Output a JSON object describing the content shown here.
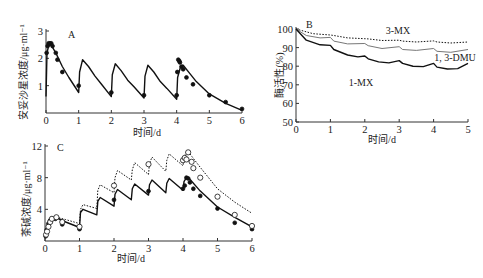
{
  "chart_data": [
    {
      "panel": "A",
      "type": "line",
      "title": "",
      "panel_label": "A",
      "xlabel": "时间/d",
      "ylabel": "安妥沙星浓度/μg·ml⁻¹",
      "xlim": [
        0,
        6
      ],
      "ylim": [
        0,
        3
      ],
      "xticks": [
        "0",
        "1",
        "2",
        "3",
        "4",
        "5",
        "6"
      ],
      "yticks": [
        "1",
        "2",
        "3"
      ],
      "grid": false,
      "series": [
        {
          "name": "model",
          "style": "solid",
          "x": [
            0,
            0.03,
            0.08,
            0.15,
            0.3,
            0.5,
            0.7,
            1.0,
            1.03,
            1.12,
            1.3,
            1.5,
            1.7,
            2.0,
            2.03,
            2.12,
            2.3,
            2.5,
            2.7,
            3.0,
            3.03,
            3.12,
            3.3,
            3.5,
            3.7,
            4.0,
            4.03,
            4.12,
            4.2,
            4.4,
            4.6,
            5.0,
            5.5,
            6.0
          ],
          "y": [
            0.6,
            2.2,
            2.45,
            2.5,
            2.2,
            1.7,
            1.3,
            0.75,
            1.5,
            1.95,
            1.7,
            1.35,
            1.05,
            0.6,
            1.4,
            1.8,
            1.55,
            1.2,
            0.95,
            0.55,
            1.35,
            1.75,
            1.5,
            1.15,
            0.9,
            0.5,
            1.3,
            1.7,
            1.75,
            1.45,
            1.15,
            0.7,
            0.35,
            0.1
          ]
        },
        {
          "name": "observed",
          "style": "filled-circle",
          "x": [
            0.02,
            0.05,
            0.08,
            0.12,
            0.16,
            0.2,
            0.3,
            0.35,
            0.5,
            1.0,
            2.0,
            3.0,
            4.0,
            4.02,
            4.05,
            4.08,
            4.1,
            4.15,
            4.2,
            4.3,
            4.5,
            5.0,
            5.5,
            6.0
          ],
          "y": [
            2.2,
            2.45,
            2.55,
            2.55,
            2.55,
            2.45,
            2.2,
            1.95,
            1.5,
            1.0,
            0.75,
            0.65,
            0.65,
            1.5,
            1.95,
            1.9,
            1.85,
            1.7,
            1.6,
            1.3,
            1.05,
            0.65,
            0.4,
            0.15
          ]
        }
      ]
    },
    {
      "panel": "B",
      "type": "line",
      "panel_label": "B",
      "xlabel": "时间/d",
      "ylabel": "酶活性(%)",
      "xlim": [
        0,
        5
      ],
      "ylim": [
        50,
        100
      ],
      "xticks": [
        "0",
        "1",
        "2",
        "3",
        "4",
        "5"
      ],
      "yticks": [
        "50",
        "60",
        "70",
        "80",
        "90",
        "100"
      ],
      "grid": false,
      "series": [
        {
          "name": "3-MX",
          "style": "dotted",
          "x": [
            0,
            0.5,
            1.0,
            1.1,
            1.5,
            2.0,
            2.1,
            2.5,
            3.0,
            3.1,
            3.5,
            4.0,
            4.1,
            4.5,
            5.0
          ],
          "y": [
            100,
            97.5,
            96.8,
            96.5,
            95.2,
            94.8,
            94.7,
            93.8,
            94,
            93.5,
            93,
            93.6,
            93,
            92.5,
            93
          ]
        },
        {
          "name": "1, 3-DMU",
          "style": "solid-gray",
          "x": [
            0,
            0.3,
            0.7,
            1.0,
            1.1,
            1.5,
            2.0,
            2.1,
            2.5,
            3.0,
            3.1,
            3.5,
            4.0,
            4.1,
            4.5,
            5.0
          ],
          "y": [
            100,
            96.5,
            95.2,
            95.5,
            93.5,
            92,
            92.2,
            91,
            89.5,
            90.5,
            89,
            88.5,
            89.5,
            88,
            87.5,
            89
          ]
        },
        {
          "name": "1-MX",
          "style": "solid",
          "x": [
            0,
            0.3,
            0.7,
            1.0,
            1.1,
            1.5,
            1.8,
            2.0,
            2.1,
            2.4,
            2.7,
            3.0,
            3.1,
            3.4,
            3.7,
            4.0,
            4.1,
            4.4,
            4.7,
            5.0
          ],
          "y": [
            100,
            94,
            91.5,
            91.2,
            89,
            86,
            85,
            85.5,
            84,
            82.3,
            81.8,
            83,
            81.5,
            80,
            79.8,
            81.5,
            79.5,
            78.5,
            78.7,
            81.5
          ]
        }
      ],
      "annotations": [
        "3-MX",
        "1, 3-DMU",
        "1-MX"
      ]
    },
    {
      "panel": "C",
      "type": "line",
      "panel_label": "C",
      "xlabel": "时间/d",
      "ylabel": "茶碱浓度/μg·ml⁻¹",
      "xlim": [
        0,
        6
      ],
      "ylim": [
        0,
        12
      ],
      "xticks": [
        "0",
        "1",
        "2",
        "3",
        "4",
        "5",
        "6"
      ],
      "yticks": [
        "4",
        "8",
        "12"
      ],
      "grid": false,
      "series": [
        {
          "name": "model-solid",
          "style": "solid",
          "x": [
            0,
            0.1,
            0.2,
            0.35,
            0.6,
            1.0,
            1.03,
            1.1,
            1.5,
            1.53,
            1.6,
            2.0,
            2.03,
            2.1,
            2.5,
            2.53,
            2.6,
            3.0,
            3.03,
            3.1,
            3.5,
            3.53,
            3.6,
            4.0,
            4.03,
            4.1,
            4.2,
            4.5,
            5.0,
            5.5,
            6.0
          ],
          "y": [
            0.6,
            2.3,
            2.8,
            2.9,
            2.4,
            1.7,
            3.6,
            4.0,
            3.3,
            5.0,
            5.5,
            4.4,
            5.9,
            6.5,
            5.2,
            6.6,
            7.2,
            5.8,
            7.1,
            7.7,
            6.1,
            7.3,
            7.9,
            6.4,
            7.5,
            8.0,
            7.8,
            6.3,
            4.3,
            3.0,
            1.8
          ]
        },
        {
          "name": "model-dotted",
          "style": "dotted",
          "x": [
            0,
            0.1,
            0.2,
            0.35,
            0.6,
            1.0,
            1.03,
            1.1,
            1.5,
            1.53,
            1.6,
            2.0,
            2.03,
            2.1,
            2.5,
            2.53,
            2.6,
            3.0,
            3.03,
            3.1,
            3.5,
            3.53,
            3.6,
            4.0,
            4.03,
            4.1,
            4.2,
            4.5,
            5.0,
            5.5,
            6.0
          ],
          "y": [
            0.6,
            2.4,
            2.9,
            3.0,
            2.7,
            2.2,
            4.0,
            4.6,
            4.1,
            6.4,
            7.1,
            6.1,
            8.0,
            8.9,
            7.7,
            9.0,
            9.9,
            8.4,
            9.8,
            10.6,
            8.8,
            10.2,
            11.0,
            9.5,
            10.5,
            11.3,
            11.0,
            9.3,
            6.6,
            4.9,
            3.5
          ]
        },
        {
          "name": "observed-filled",
          "style": "filled-circle",
          "x": [
            0.02,
            0.05,
            0.1,
            0.15,
            0.2,
            0.3,
            0.5,
            1.0,
            2.0,
            3.0,
            4.0,
            4.05,
            4.1,
            4.15,
            4.2,
            4.3,
            4.5,
            5.0,
            5.5,
            6.0
          ],
          "y": [
            0.6,
            1.4,
            2.2,
            2.6,
            2.8,
            2.8,
            2.1,
            1.5,
            5.2,
            6.3,
            6.6,
            7.0,
            8.0,
            7.9,
            7.4,
            6.6,
            5.7,
            4.1,
            2.3,
            1.5
          ]
        },
        {
          "name": "observed-open",
          "style": "open-circle",
          "x": [
            0.03,
            0.06,
            0.1,
            0.15,
            0.2,
            0.33,
            0.5,
            1.0,
            2.0,
            3.0,
            4.0,
            4.05,
            4.1,
            4.15,
            4.25,
            4.3,
            4.5,
            5.0,
            5.5,
            6.0
          ],
          "y": [
            0.8,
            1.2,
            1.8,
            2.4,
            2.8,
            3.0,
            2.4,
            1.8,
            7.0,
            9.7,
            10.2,
            10.5,
            10.3,
            11.2,
            10.0,
            9.2,
            8.0,
            5.6,
            3.3,
            1.9
          ]
        }
      ]
    }
  ],
  "panels": {
    "A": {
      "label": "A",
      "xlabel": "时间/d",
      "ylabel": "安妥沙星浓度/μg·ml⁻¹"
    },
    "B": {
      "label": "B",
      "xlabel": "时间/d",
      "ylabel": "酶活性(%)",
      "ann_3mx": "3-MX",
      "ann_dmu": "1, 3-DMU",
      "ann_1mx": "1-MX"
    },
    "C": {
      "label": "C",
      "xlabel": "时间/d",
      "ylabel": "茶碱浓度/μg·ml⁻¹"
    }
  }
}
